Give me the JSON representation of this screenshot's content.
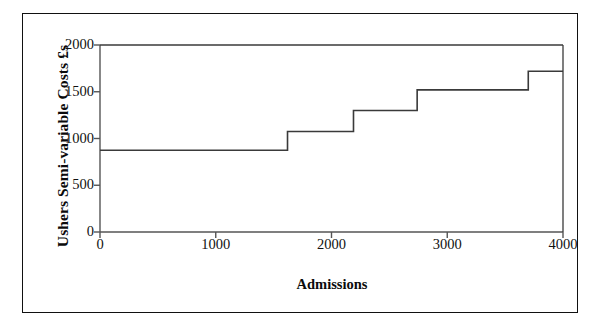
{
  "figure": {
    "frame_color": "#111111",
    "background": "#ffffff",
    "line_color": "#3a3a3a",
    "axis_color": "#555555"
  },
  "chart_data": {
    "type": "line",
    "subtype": "step",
    "title": "",
    "xlabel": "Admissions",
    "ylabel": "Ushers Semi-variable Costs £s",
    "xlim": [
      0,
      4000
    ],
    "ylim": [
      0,
      2000
    ],
    "xticks": [
      0,
      1000,
      2000,
      3000,
      4000
    ],
    "xtick_labels": [
      "0",
      "1000",
      "2000",
      "3000",
      "4000"
    ],
    "yticks": [
      0,
      500,
      1000,
      1500,
      2000
    ],
    "ytick_labels": [
      "0",
      "500",
      "1000",
      "1500",
      "2000"
    ],
    "grid": false,
    "legend": false,
    "series": [
      {
        "name": "Ushers Semi-variable Costs",
        "step_edges": [
          0,
          1620,
          2190,
          2740,
          3700,
          4000
        ],
        "values": [
          875,
          1075,
          1300,
          1520,
          1720
        ],
        "points": [
          {
            "x": 0,
            "y": 875
          },
          {
            "x": 1620,
            "y": 875
          },
          {
            "x": 1620,
            "y": 1075
          },
          {
            "x": 2190,
            "y": 1075
          },
          {
            "x": 2190,
            "y": 1300
          },
          {
            "x": 2740,
            "y": 1300
          },
          {
            "x": 2740,
            "y": 1520
          },
          {
            "x": 3700,
            "y": 1520
          },
          {
            "x": 3700,
            "y": 1720
          },
          {
            "x": 4000,
            "y": 1720
          }
        ]
      }
    ]
  }
}
